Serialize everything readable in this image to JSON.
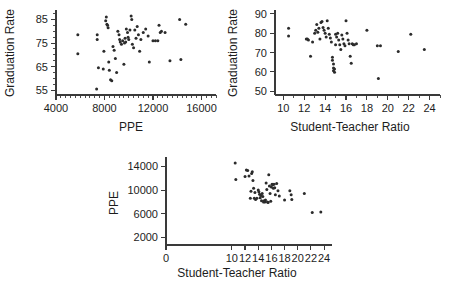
{
  "figure": {
    "background_color": "#ffffff",
    "marker_color": "#2b2b2b",
    "axis_color": "#3a3a3a"
  },
  "chart_data": [
    {
      "id": "ppe-vs-graduation-rate",
      "type": "scatter",
      "title": "",
      "xlabel": "PPE",
      "ylabel": "Graduation Rate",
      "xlim": [
        4000,
        17200
      ],
      "ylim": [
        53,
        89
      ],
      "xticks": [
        4000,
        8000,
        12000,
        16000
      ],
      "xtick_labels": [
        "4000",
        "8000",
        "12000",
        "16000"
      ],
      "x_minor_tick_step": 400,
      "yticks": [
        55,
        65,
        75,
        85
      ],
      "ytick_labels": [
        "55",
        "65",
        "75",
        "85"
      ],
      "y_minor_tick_step": 2.5,
      "grid": false,
      "legend": "none",
      "x": [
        5800,
        5800,
        7350,
        7400,
        7400,
        7500,
        7900,
        7950,
        8100,
        8150,
        8200,
        8250,
        8300,
        8350,
        8400,
        8500,
        8600,
        8700,
        8800,
        8900,
        9000,
        9100,
        9200,
        9250,
        9300,
        9400,
        9500,
        9600,
        9650,
        9700,
        9750,
        9800,
        9900,
        9950,
        10000,
        10100,
        10200,
        10250,
        10300,
        10400,
        10500,
        10600,
        10700,
        10800,
        10900,
        11000,
        11200,
        11400,
        11600,
        11700,
        12000,
        12200,
        12400,
        12500,
        12600,
        12700,
        13000,
        13400,
        14200,
        14300,
        14700
      ],
      "y": [
        78.5,
        70.5,
        55.5,
        78.5,
        76.5,
        64.5,
        64.0,
        71.5,
        84.5,
        86.0,
        83.0,
        82.5,
        81.5,
        67.0,
        63.5,
        59.5,
        59.0,
        73.5,
        72.0,
        68.5,
        62.5,
        80.0,
        78.5,
        76.5,
        75.5,
        74.5,
        76.0,
        66.0,
        75.0,
        77.0,
        75.5,
        81.0,
        79.5,
        77.5,
        76.5,
        80.5,
        86.5,
        85.0,
        74.5,
        73.0,
        80.5,
        77.0,
        82.0,
        78.5,
        71.5,
        76.5,
        79.5,
        81.0,
        78.0,
        67.0,
        76.0,
        76.0,
        76.0,
        82.5,
        79.5,
        80.0,
        79.5,
        67.5,
        85.0,
        68.0,
        83.0
      ]
    },
    {
      "id": "student-teacher-ratio-vs-graduation-rate",
      "type": "scatter",
      "title": "",
      "xlabel": "Student-Teacher Ratio",
      "ylabel": "Graduation Rate",
      "xlim": [
        9.2,
        25.0
      ],
      "ylim": [
        48,
        92
      ],
      "xticks": [
        10,
        12,
        14,
        16,
        18,
        20,
        22,
        24
      ],
      "xtick_labels": [
        "10",
        "12",
        "14",
        "16",
        "18",
        "20",
        "22",
        "24"
      ],
      "x_minor_tick_step": 1,
      "yticks": [
        50,
        60,
        70,
        80,
        90
      ],
      "ytick_labels": [
        "50",
        "60",
        "70",
        "80",
        "90"
      ],
      "grid": false,
      "legend": "none",
      "x": [
        10.5,
        10.5,
        12.2,
        12.3,
        12.4,
        12.6,
        12.8,
        13.0,
        13.1,
        13.2,
        13.3,
        13.4,
        13.5,
        13.6,
        13.7,
        13.8,
        13.9,
        14.0,
        14.1,
        14.2,
        14.3,
        14.4,
        14.5,
        14.6,
        14.7,
        14.7,
        14.8,
        14.8,
        14.8,
        14.9,
        14.9,
        15.0,
        15.0,
        15.1,
        15.2,
        15.3,
        15.4,
        15.5,
        15.6,
        15.7,
        15.8,
        15.9,
        16.0,
        16.1,
        16.2,
        16.3,
        16.4,
        16.5,
        16.6,
        16.7,
        16.8,
        17.0,
        18.0,
        19.0,
        19.1,
        19.3,
        21.0,
        22.2,
        23.5
      ],
      "y": [
        82.5,
        78.5,
        77.0,
        77.0,
        76.5,
        68.0,
        75.5,
        80.0,
        81.5,
        84.5,
        80.5,
        82.5,
        77.0,
        85.5,
        86.0,
        83.0,
        81.5,
        80.0,
        78.0,
        86.5,
        82.5,
        79.5,
        77.5,
        75.5,
        67.5,
        66.0,
        64.0,
        62.0,
        60.5,
        61.5,
        59.8,
        79.5,
        74.0,
        78.0,
        80.0,
        76.5,
        74.0,
        71.5,
        79.0,
        77.0,
        74.5,
        73.5,
        86.5,
        80.0,
        76.5,
        74.5,
        68.0,
        64.5,
        74.5,
        74.0,
        74.0,
        74.5,
        81.5,
        73.5,
        56.5,
        73.5,
        70.5,
        79.5,
        71.5
      ]
    },
    {
      "id": "student-teacher-ratio-vs-ppe",
      "type": "scatter",
      "title": "",
      "xlabel": "Student-Teacher Ratio",
      "ylabel": "PPE",
      "xlim": [
        0,
        25.2
      ],
      "ylim": [
        700,
        15600
      ],
      "xticks": [
        0,
        10,
        12,
        14,
        16,
        18,
        20,
        22,
        24
      ],
      "xtick_labels": [
        "0",
        "10",
        "12",
        "14",
        "16",
        "18",
        "20",
        "22",
        "24"
      ],
      "yticks": [
        2000,
        6000,
        10000,
        14000
      ],
      "ytick_labels": [
        "2000",
        "6000",
        "10000",
        "14000"
      ],
      "grid": false,
      "legend": "none",
      "x": [
        10.5,
        10.6,
        12.0,
        12.2,
        12.4,
        12.6,
        12.8,
        12.9,
        13.0,
        13.1,
        13.2,
        13.3,
        13.4,
        13.5,
        13.6,
        13.8,
        14.0,
        14.1,
        14.2,
        14.3,
        14.4,
        14.5,
        14.6,
        14.7,
        14.8,
        14.9,
        15.0,
        15.1,
        15.2,
        15.3,
        15.4,
        15.5,
        15.6,
        15.7,
        15.8,
        15.9,
        16.0,
        16.1,
        16.2,
        16.3,
        16.4,
        16.5,
        16.6,
        16.8,
        17.0,
        17.2,
        18.0,
        18.8,
        19.0,
        19.1,
        21.0,
        22.2,
        23.5
      ],
      "y": [
        14600,
        11800,
        12300,
        13400,
        13300,
        12400,
        8600,
        9800,
        12800,
        13100,
        11600,
        10300,
        8600,
        9600,
        8400,
        8600,
        10000,
        9700,
        9300,
        8700,
        9100,
        8200,
        9400,
        8900,
        8000,
        8200,
        8000,
        8300,
        11200,
        10100,
        8000,
        7900,
        12600,
        10700,
        9400,
        8100,
        10500,
        11000,
        10900,
        10300,
        11000,
        10400,
        9200,
        11100,
        9900,
        9000,
        8300,
        9900,
        9200,
        8400,
        9400,
        6200,
        6300
      ]
    }
  ]
}
